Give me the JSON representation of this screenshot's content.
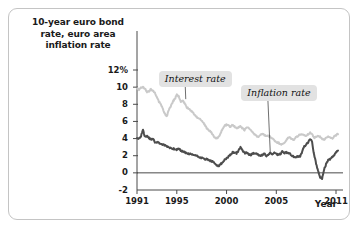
{
  "figure": {
    "axis_title": "10-year euro bond rate, euro area inflation rate",
    "axis_title_lines": [
      "10-year euro bond",
      "rate, euro area",
      "inflation rate"
    ],
    "xaxis_name": "Year",
    "label_interest": "Interest rate",
    "label_inflation": "Inflation rate",
    "colors": {
      "interest_line": "#c9c9c9",
      "inflation_line": "#4d4d4d",
      "axis": "#4a4a4a",
      "label_box": "#e2e2e2",
      "frame": "#c4c4c4",
      "text": "#1a1a1a"
    }
  },
  "chart_data": {
    "type": "line",
    "title": "10-year euro bond rate, euro area inflation rate",
    "xlabel": "Year",
    "ylabel": "10-year euro bond rate, euro area inflation rate",
    "ylim": [
      -2,
      12
    ],
    "xlim": [
      1991,
      2011.3
    ],
    "yticks": [
      -2,
      0,
      2,
      4,
      6,
      8,
      10,
      12
    ],
    "ytick_labels": [
      "-2",
      "0",
      "2",
      "4",
      "6",
      "8",
      "10",
      "12%"
    ],
    "xticks": [
      1991,
      1995,
      2000,
      2005,
      2011
    ],
    "xtick_labels": [
      "1991",
      "1995",
      "2000",
      "2005",
      "2011"
    ],
    "grid": false,
    "zero_line": true,
    "legend": "inline-annotations",
    "annotations": [
      {
        "text": "Interest rate",
        "x": 1995.6,
        "y": 11.1,
        "points_to_x": 1995.9,
        "points_to_y": 8.6
      },
      {
        "text": "Inflation rate",
        "x": 2003.9,
        "y": 9.4,
        "points_to_x": 2004.4,
        "points_to_y": 2.2
      }
    ],
    "series": [
      {
        "name": "Interest rate",
        "color": "#c9c9c9",
        "x": [
          1991.0,
          1991.2,
          1991.4,
          1991.6,
          1991.8,
          1992.0,
          1992.2,
          1992.4,
          1992.6,
          1992.8,
          1993.0,
          1993.2,
          1993.4,
          1993.6,
          1993.8,
          1994.0,
          1994.2,
          1994.4,
          1994.6,
          1994.8,
          1995.0,
          1995.2,
          1995.4,
          1995.6,
          1995.8,
          1996.0,
          1996.2,
          1996.4,
          1996.6,
          1996.8,
          1997.0,
          1997.2,
          1997.4,
          1997.6,
          1997.8,
          1998.0,
          1998.2,
          1998.4,
          1998.6,
          1998.8,
          1999.0,
          1999.2,
          1999.4,
          1999.6,
          1999.8,
          2000.0,
          2000.2,
          2000.4,
          2000.6,
          2000.8,
          2001.0,
          2001.2,
          2001.4,
          2001.6,
          2001.8,
          2002.0,
          2002.2,
          2002.4,
          2002.6,
          2002.8,
          2003.0,
          2003.2,
          2003.4,
          2003.6,
          2003.8,
          2004.0,
          2004.2,
          2004.4,
          2004.6,
          2004.8,
          2005.0,
          2005.2,
          2005.4,
          2005.6,
          2005.8,
          2006.0,
          2006.2,
          2006.4,
          2006.6,
          2006.8,
          2007.0,
          2007.2,
          2007.4,
          2007.6,
          2007.8,
          2008.0,
          2008.2,
          2008.4,
          2008.6,
          2008.8,
          2009.0,
          2009.2,
          2009.4,
          2009.6,
          2009.8,
          2010.0,
          2010.2,
          2010.4,
          2010.6,
          2010.8,
          2011.0,
          2011.2
        ],
        "values": [
          9.9,
          9.7,
          9.9,
          10.0,
          9.8,
          9.4,
          9.5,
          9.8,
          9.6,
          9.3,
          8.9,
          8.3,
          8.0,
          7.4,
          6.9,
          6.6,
          7.3,
          7.8,
          8.3,
          8.6,
          9.1,
          8.9,
          8.3,
          8.4,
          8.1,
          7.6,
          7.5,
          7.3,
          7.1,
          6.8,
          6.5,
          6.4,
          6.2,
          6.0,
          5.6,
          5.2,
          5.0,
          4.8,
          4.5,
          4.1,
          4.0,
          4.2,
          4.6,
          5.2,
          5.5,
          5.6,
          5.5,
          5.4,
          5.6,
          5.4,
          5.2,
          5.3,
          5.4,
          5.2,
          5.0,
          5.3,
          5.3,
          5.1,
          4.7,
          4.5,
          4.3,
          4.2,
          4.4,
          4.5,
          4.4,
          4.3,
          4.3,
          4.2,
          4.0,
          3.8,
          3.6,
          3.5,
          3.4,
          3.3,
          3.5,
          3.8,
          4.1,
          4.1,
          3.9,
          3.9,
          4.2,
          4.3,
          4.5,
          4.4,
          4.4,
          4.3,
          4.5,
          4.7,
          4.5,
          4.1,
          4.2,
          4.3,
          4.2,
          4.0,
          3.9,
          4.1,
          4.3,
          4.1,
          4.0,
          4.2,
          4.4,
          4.5
        ]
      },
      {
        "name": "Inflation rate",
        "color": "#4d4d4d",
        "x": [
          1991.0,
          1991.2,
          1991.4,
          1991.6,
          1991.8,
          1992.0,
          1992.2,
          1992.4,
          1992.6,
          1992.8,
          1993.0,
          1993.2,
          1993.4,
          1993.6,
          1993.8,
          1994.0,
          1994.2,
          1994.4,
          1994.6,
          1994.8,
          1995.0,
          1995.2,
          1995.4,
          1995.6,
          1995.8,
          1996.0,
          1996.2,
          1996.4,
          1996.6,
          1996.8,
          1997.0,
          1997.2,
          1997.4,
          1997.6,
          1997.8,
          1998.0,
          1998.2,
          1998.4,
          1998.6,
          1998.8,
          1999.0,
          1999.2,
          1999.4,
          1999.6,
          1999.8,
          2000.0,
          2000.2,
          2000.4,
          2000.6,
          2000.8,
          2001.0,
          2001.2,
          2001.4,
          2001.6,
          2001.8,
          2002.0,
          2002.2,
          2002.4,
          2002.6,
          2002.8,
          2003.0,
          2003.2,
          2003.4,
          2003.6,
          2003.8,
          2004.0,
          2004.2,
          2004.4,
          2004.6,
          2004.8,
          2005.0,
          2005.2,
          2005.4,
          2005.6,
          2005.8,
          2006.0,
          2006.2,
          2006.4,
          2006.6,
          2006.8,
          2007.0,
          2007.2,
          2007.4,
          2007.6,
          2007.8,
          2008.0,
          2008.2,
          2008.4,
          2008.6,
          2008.8,
          2009.0,
          2009.2,
          2009.4,
          2009.6,
          2009.8,
          2010.0,
          2010.2,
          2010.4,
          2010.6,
          2010.8,
          2011.0,
          2011.2
        ],
        "values": [
          4.1,
          4.0,
          4.3,
          5.0,
          4.2,
          4.3,
          4.1,
          3.9,
          4.0,
          3.6,
          3.6,
          3.5,
          3.4,
          3.3,
          3.2,
          3.1,
          3.0,
          2.9,
          2.8,
          2.8,
          2.7,
          2.8,
          2.6,
          2.5,
          2.4,
          2.3,
          2.2,
          2.2,
          2.1,
          2.1,
          2.0,
          1.9,
          1.8,
          1.7,
          1.6,
          1.6,
          1.5,
          1.4,
          1.3,
          1.1,
          0.9,
          0.8,
          1.0,
          1.2,
          1.5,
          1.7,
          1.9,
          2.1,
          2.4,
          2.3,
          2.3,
          2.6,
          3.0,
          2.6,
          2.3,
          2.4,
          2.2,
          2.1,
          2.2,
          2.3,
          2.3,
          2.1,
          2.0,
          2.1,
          2.2,
          2.0,
          2.1,
          2.3,
          2.2,
          2.3,
          2.2,
          2.1,
          2.2,
          2.5,
          2.3,
          2.4,
          2.3,
          2.2,
          2.0,
          1.8,
          1.9,
          1.9,
          1.9,
          2.5,
          3.1,
          3.3,
          3.6,
          4.0,
          3.6,
          2.1,
          1.1,
          0.2,
          -0.5,
          -0.7,
          0.4,
          1.0,
          1.5,
          1.6,
          1.8,
          2.0,
          2.4,
          2.6
        ]
      }
    ]
  }
}
